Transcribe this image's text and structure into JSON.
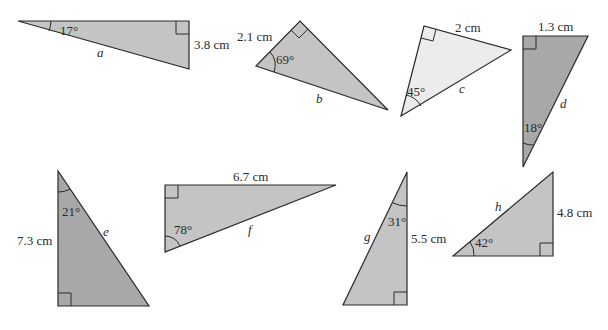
{
  "colors": {
    "medium": "#c4c4c4",
    "dark": "#a8a8a8",
    "light": "#ececec",
    "stroke": "#2a2a2a"
  },
  "triangles": [
    {
      "id": "a",
      "unknown": "a",
      "angle": "17°",
      "side": "3.8 cm"
    },
    {
      "id": "b",
      "unknown": "b",
      "angle": "69°",
      "side": "2.1 cm"
    },
    {
      "id": "c",
      "unknown": "c",
      "angle": "45°",
      "side": "2 cm"
    },
    {
      "id": "d",
      "unknown": "d",
      "angle": "18°",
      "side": "1.3 cm"
    },
    {
      "id": "e",
      "unknown": "e",
      "angle": "21°",
      "side": "7.3 cm"
    },
    {
      "id": "f",
      "unknown": "f",
      "angle": "78°",
      "side": "6.7 cm"
    },
    {
      "id": "g",
      "unknown": "g",
      "angle": "31°",
      "side": "5.5 cm"
    },
    {
      "id": "h",
      "unknown": "h",
      "angle": "42°",
      "side": "4.8 cm"
    }
  ]
}
